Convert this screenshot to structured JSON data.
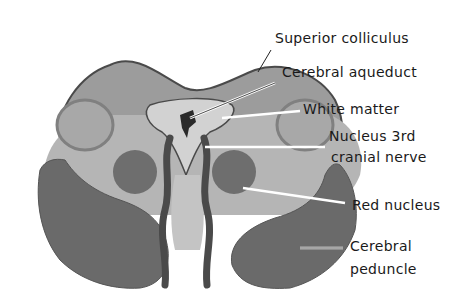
{
  "diagram": {
    "colors": {
      "background": "#ffffff",
      "tectum_fill": "#9c9c9c",
      "white_matter_fill": "#d2d2d2",
      "tegmentum_fill": "#b5b5b5",
      "red_nucleus_fill": "#6e6e6e",
      "peduncle_fill": "#6a6a6a",
      "aqueduct_fill": "#2a2a2a",
      "outline": "#4a4a4a",
      "leader_line": "#ffffff",
      "text": "#1a1a1a"
    },
    "labels": [
      {
        "id": "superior-colliculus",
        "text": "Superior colliculus"
      },
      {
        "id": "cerebral-aqueduct",
        "text": "Cerebral aqueduct"
      },
      {
        "id": "white-matter",
        "text": "White matter"
      },
      {
        "id": "nucleus-3rd-line1",
        "text": "Nucleus 3rd"
      },
      {
        "id": "nucleus-3rd-line2",
        "text": "cranial nerve"
      },
      {
        "id": "red-nucleus",
        "text": "Red nucleus"
      },
      {
        "id": "cerebral-peduncle-line1",
        "text": "Cerebral"
      },
      {
        "id": "cerebral-peduncle-line2",
        "text": "peduncle"
      }
    ]
  }
}
